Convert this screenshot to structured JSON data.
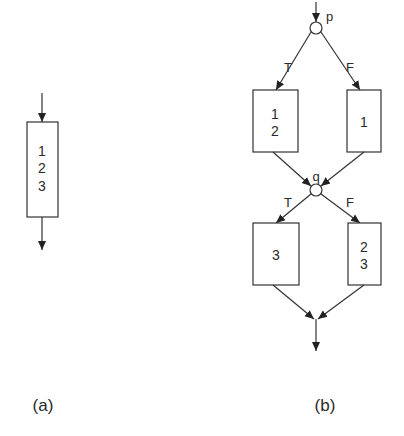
{
  "diagram_a": {
    "caption": "(a)",
    "box": {
      "lines": [
        "1",
        "2",
        "3"
      ]
    }
  },
  "diagram_b": {
    "caption": "(b)",
    "decision_p": {
      "label": "p",
      "true_label": "T",
      "false_label": "F"
    },
    "decision_q": {
      "label": "q",
      "true_label": "T",
      "false_label": "F"
    },
    "box_top_left": {
      "lines": [
        "1",
        "2"
      ]
    },
    "box_top_right": {
      "lines": [
        "1"
      ]
    },
    "box_bottom_left": {
      "lines": [
        "3"
      ]
    },
    "box_bottom_right": {
      "lines": [
        "2",
        "3"
      ]
    }
  },
  "colors": {
    "stroke": "#333333",
    "background": "#ffffff"
  }
}
